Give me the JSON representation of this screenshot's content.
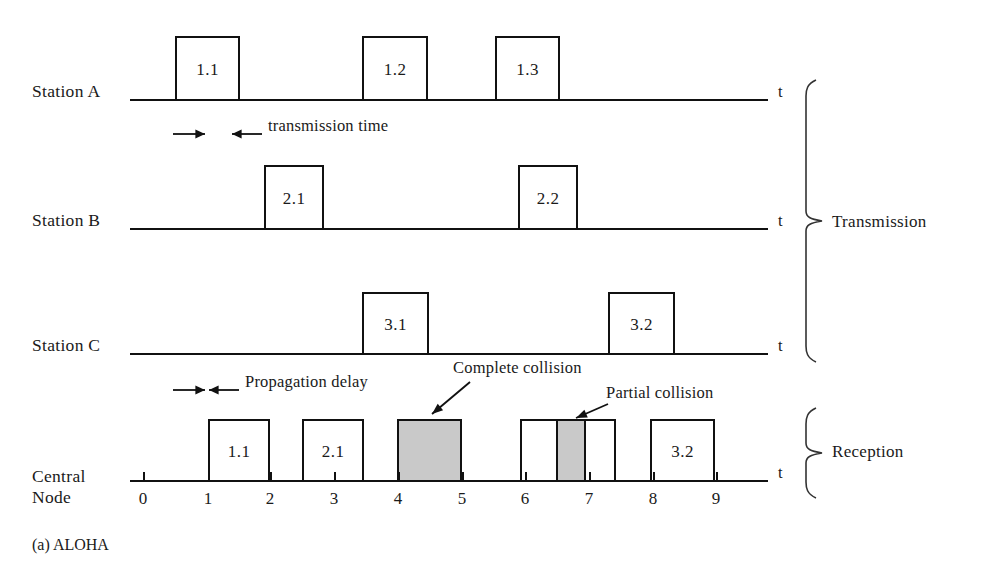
{
  "caption": "(a) ALOHA",
  "time_axis_symbol": "t",
  "rows": [
    {
      "id": "station-a",
      "label": "Station A",
      "label_x": 32,
      "label_y": 92,
      "baseline_y": 99,
      "axis_x0": 130,
      "axis_x1": 768,
      "t_label_x": 778,
      "t_label_y": 90,
      "pulses": [
        {
          "name": "1.1",
          "x": 175,
          "w": 65,
          "h": 63,
          "shaded": false
        },
        {
          "name": "1.2",
          "x": 362,
          "w": 66,
          "h": 63,
          "shaded": false
        },
        {
          "name": "1.3",
          "x": 495,
          "w": 65,
          "h": 63,
          "shaded": false
        }
      ]
    },
    {
      "id": "station-b",
      "label": "Station B",
      "label_x": 32,
      "label_y": 221,
      "baseline_y": 228,
      "axis_x0": 130,
      "axis_x1": 768,
      "t_label_x": 778,
      "t_label_y": 219,
      "pulses": [
        {
          "name": "2.1",
          "x": 264,
          "w": 60,
          "h": 63,
          "shaded": false
        },
        {
          "name": "2.2",
          "x": 518,
          "w": 60,
          "h": 63,
          "shaded": false
        }
      ]
    },
    {
      "id": "station-c",
      "label": "Station C",
      "label_x": 32,
      "label_y": 346,
      "baseline_y": 353,
      "axis_x0": 130,
      "axis_x1": 768,
      "t_label_x": 778,
      "t_label_y": 344,
      "pulses": [
        {
          "name": "3.1",
          "x": 362,
          "w": 67,
          "h": 61,
          "shaded": false
        },
        {
          "name": "3.2",
          "x": 608,
          "w": 67,
          "h": 61,
          "shaded": false
        }
      ]
    },
    {
      "id": "central-node",
      "label": "Central\nNode",
      "label_line1": "Central",
      "label_line2": "Node",
      "label_x": 32,
      "label_y": 466,
      "baseline_y": 480,
      "axis_x0": 130,
      "axis_x1": 768,
      "t_label_x": 778,
      "t_label_y": 471,
      "pulses": [
        {
          "name": "1.1",
          "x": 208,
          "w": 62,
          "h": 61,
          "shaded": false
        },
        {
          "name": "2.1",
          "x": 302,
          "w": 62,
          "h": 61,
          "shaded": false
        },
        {
          "name": "",
          "x": 397,
          "w": 65,
          "h": 61,
          "shaded": true
        },
        {
          "name": "",
          "x": 520,
          "w": 38,
          "h": 61,
          "shaded": false
        },
        {
          "name": "",
          "x": 556,
          "w": 30,
          "h": 61,
          "shaded": true
        },
        {
          "name": "",
          "x": 584,
          "w": 32,
          "h": 61,
          "shaded": false
        },
        {
          "name": "3.2",
          "x": 650,
          "w": 65,
          "h": 61,
          "shaded": false
        }
      ]
    }
  ],
  "time_axis": {
    "baseline_y": 480,
    "tick_labels": [
      "0",
      "1",
      "2",
      "3",
      "4",
      "5",
      "6",
      "7",
      "8",
      "9"
    ],
    "tick_positions": [
      143,
      208,
      270,
      334,
      398,
      462,
      525,
      589,
      653,
      716
    ],
    "tick_label_y": 489
  },
  "annotations": [
    {
      "id": "transmission-time",
      "text": "transmission time",
      "text_x": 268,
      "text_y": 126,
      "arrow_left": {
        "x1": 173,
        "y1": 134,
        "x2": 205,
        "y2": 134,
        "head": "right"
      },
      "arrow_right": {
        "x1": 262,
        "y1": 134,
        "x2": 232,
        "y2": 134,
        "head": "left"
      }
    },
    {
      "id": "propagation-delay",
      "text": "Propagation delay",
      "text_x": 245,
      "text_y": 382,
      "arrow_left": {
        "x1": 173,
        "y1": 390,
        "x2": 205,
        "y2": 390,
        "head": "right"
      },
      "arrow_right": {
        "x1": 239,
        "y1": 390,
        "x2": 209,
        "y2": 390,
        "head": "left"
      }
    },
    {
      "id": "complete-collision",
      "text": "Complete collision",
      "text_x": 453,
      "text_y": 368,
      "arrow": {
        "x1": 470,
        "y1": 382,
        "x2": 432,
        "y2": 414
      }
    },
    {
      "id": "partial-collision",
      "text": "Partial collision",
      "text_x": 606,
      "text_y": 393,
      "arrow": {
        "x1": 608,
        "y1": 404,
        "x2": 576,
        "y2": 418
      }
    }
  ],
  "brackets": [
    {
      "id": "transmission",
      "label": "Transmission",
      "x": 806,
      "y_top": 80,
      "y_bottom": 362,
      "tip_x": 822,
      "label_x": 832,
      "label_y": 214
    },
    {
      "id": "reception",
      "label": "Reception",
      "x": 806,
      "y_top": 408,
      "y_bottom": 498,
      "tip_x": 822,
      "label_x": 832,
      "label_y": 444
    }
  ],
  "colors": {
    "line": "#111111",
    "shade": "#c9c9c9",
    "background": "#ffffff",
    "text": "#1a1a1a"
  }
}
